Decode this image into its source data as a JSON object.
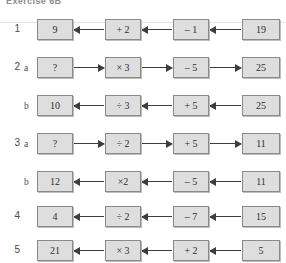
{
  "header": {
    "title": "Exercise 6B"
  },
  "rows": [
    {
      "num": "1",
      "sub": "",
      "direction": "left",
      "cells": [
        "9",
        "+ 2",
        "– 1",
        "19"
      ]
    },
    {
      "num": "2",
      "sub": "a",
      "direction": "right",
      "cells": [
        "?",
        "× 3",
        "– 5",
        "25"
      ]
    },
    {
      "num": "",
      "sub": "b",
      "direction": "left",
      "cells": [
        "10",
        "÷ 3",
        "+ 5",
        "25"
      ]
    },
    {
      "num": "3",
      "sub": "a",
      "direction": "right",
      "cells": [
        "?",
        "÷ 2",
        "+ 5",
        "11"
      ]
    },
    {
      "num": "",
      "sub": "b",
      "direction": "left",
      "cells": [
        "12",
        "×2",
        "– 5",
        "11"
      ]
    },
    {
      "num": "4",
      "sub": "",
      "direction": "left",
      "cells": [
        "4",
        "÷ 2",
        "– 7",
        "15"
      ]
    },
    {
      "num": "5",
      "sub": "",
      "direction": "left",
      "cells": [
        "21",
        "× 3",
        "+ 2",
        "5"
      ]
    }
  ]
}
